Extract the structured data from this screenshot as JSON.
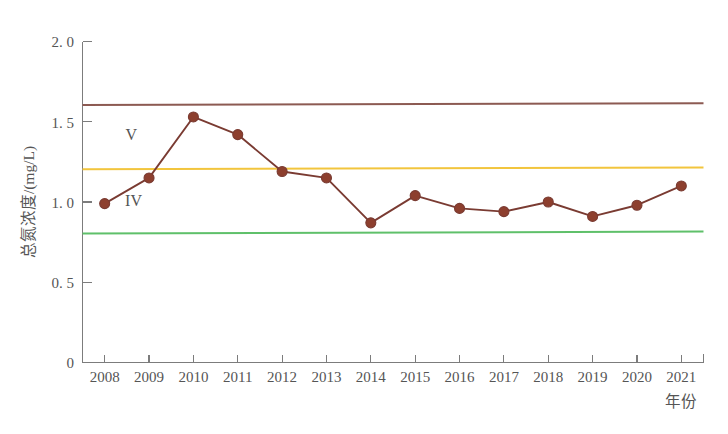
{
  "chart_data": {
    "type": "line",
    "title": "",
    "xlabel": "年份",
    "ylabel": "总氮浓度/(mg/L)",
    "x": [
      2008,
      2009,
      2010,
      2011,
      2012,
      2013,
      2014,
      2015,
      2016,
      2017,
      2018,
      2019,
      2020,
      2021
    ],
    "categories": [
      "2008",
      "2009",
      "2010",
      "2011",
      "2012",
      "2013",
      "2014",
      "2015",
      "2016",
      "2017",
      "2018",
      "2019",
      "2020",
      "2021"
    ],
    "values": [
      0.99,
      1.15,
      1.53,
      1.42,
      1.19,
      1.15,
      0.87,
      1.04,
      0.96,
      0.94,
      1.0,
      0.91,
      0.98,
      1.1
    ],
    "series": [
      {
        "name": "总氮浓度",
        "values": [
          0.99,
          1.15,
          1.53,
          1.42,
          1.19,
          1.15,
          0.87,
          1.04,
          0.96,
          0.94,
          1.0,
          0.91,
          0.98,
          1.1
        ],
        "color": "#7a3b32",
        "marker": "circle",
        "marker_color": "#8d3f2e"
      }
    ],
    "ylim": [
      0,
      2.0
    ],
    "yticks": [
      0,
      0.5,
      1.0,
      1.5,
      2.0
    ],
    "ytick_labels": [
      "0",
      "0. 5",
      "1. 0",
      "1. 5",
      "2. 0"
    ],
    "xlim": [
      2007.5,
      2021.5
    ],
    "grid": false,
    "legend": null,
    "reference_lines": [
      {
        "name": "class-v-upper",
        "value": 1.61,
        "color": "#8c5a52",
        "label": ""
      },
      {
        "name": "class-v-lower",
        "value": 1.21,
        "color": "#f2c53d",
        "label": ""
      },
      {
        "name": "class-iv-lower",
        "value": 0.81,
        "color": "#5fc06a",
        "label": ""
      }
    ],
    "annotations": [
      {
        "text": "V",
        "x": 2008.6,
        "y": 1.385
      },
      {
        "text": "IV",
        "x": 2008.65,
        "y": 0.975
      }
    ]
  }
}
